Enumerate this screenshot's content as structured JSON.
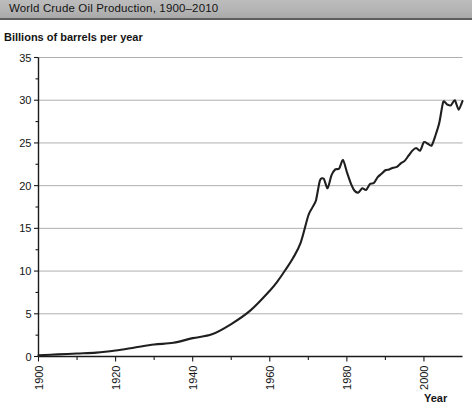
{
  "title": "World Crude Oil Production, 1900–2010",
  "axis": {
    "ylabel": "Billions of barrels per year",
    "xlabel": "Year"
  },
  "ticks": {
    "y": [
      "0",
      "5",
      "10",
      "15",
      "20",
      "25",
      "30",
      "35"
    ],
    "x": [
      "1900",
      "1920",
      "1940",
      "1960",
      "1980",
      "2000"
    ]
  },
  "colors": {
    "title_bar": "#b4b4b4",
    "line": "#1f1f1f",
    "grid": "#9a9a9a",
    "axis": "#1a1a1a",
    "background": "#ffffff"
  },
  "chart_data": {
    "type": "line",
    "title": "World Crude Oil Production, 1900–2010",
    "xlabel": "Year",
    "ylabel": "Billions of barrels per year",
    "xlim": [
      1900,
      2010
    ],
    "ylim": [
      0,
      35
    ],
    "xtick_step": 20,
    "xminor_step": 10,
    "ytick_step": 5,
    "yminor_step": 2.5,
    "grid": "horizontal",
    "legend": "none",
    "series": [
      {
        "name": "World crude oil production",
        "units": "billions of barrels per year",
        "x": [
          1900,
          1905,
          1910,
          1915,
          1920,
          1925,
          1930,
          1935,
          1940,
          1945,
          1950,
          1955,
          1960,
          1962,
          1964,
          1966,
          1968,
          1970,
          1971,
          1972,
          1973,
          1974,
          1975,
          1976,
          1977,
          1978,
          1979,
          1980,
          1981,
          1982,
          1983,
          1984,
          1985,
          1986,
          1987,
          1988,
          1989,
          1990,
          1991,
          1992,
          1993,
          1994,
          1995,
          1996,
          1997,
          1998,
          1999,
          2000,
          2001,
          2002,
          2003,
          2004,
          2005,
          2006,
          2007,
          2008,
          2009,
          2010
        ],
        "y": [
          0.15,
          0.25,
          0.35,
          0.45,
          0.7,
          1.05,
          1.4,
          1.6,
          2.15,
          2.6,
          3.8,
          5.4,
          7.7,
          8.8,
          10.1,
          11.5,
          13.3,
          16.5,
          17.4,
          18.3,
          20.6,
          20.8,
          19.7,
          21.2,
          21.9,
          22.0,
          23.0,
          21.6,
          20.3,
          19.4,
          19.2,
          19.7,
          19.5,
          20.2,
          20.3,
          21.0,
          21.4,
          21.8,
          21.9,
          22.1,
          22.2,
          22.6,
          22.9,
          23.5,
          24.1,
          24.4,
          24.1,
          25.1,
          24.9,
          24.7,
          25.9,
          27.4,
          29.8,
          29.5,
          29.4,
          30.0,
          28.9,
          29.9
        ]
      }
    ]
  }
}
